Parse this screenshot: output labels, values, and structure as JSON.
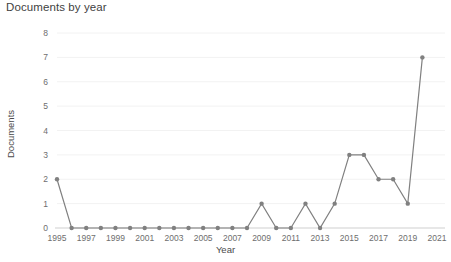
{
  "chart_data": {
    "type": "line",
    "title": "Documents by year",
    "xlabel": "Year",
    "ylabel": "Documents",
    "x": [
      1995,
      1996,
      1997,
      1998,
      1999,
      2000,
      2001,
      2002,
      2003,
      2004,
      2005,
      2006,
      2007,
      2008,
      2009,
      2010,
      2011,
      2012,
      2013,
      2014,
      2015,
      2016,
      2017,
      2018,
      2019,
      2020
    ],
    "values": [
      2,
      0,
      0,
      0,
      0,
      0,
      0,
      0,
      0,
      0,
      0,
      0,
      0,
      0,
      1,
      0,
      0,
      1,
      0,
      1,
      3,
      3,
      2,
      2,
      1,
      7
    ],
    "series": [
      {
        "name": "Documents",
        "values": [
          2,
          0,
          0,
          0,
          0,
          0,
          0,
          0,
          0,
          0,
          0,
          0,
          0,
          0,
          1,
          0,
          0,
          1,
          0,
          1,
          3,
          3,
          2,
          2,
          1,
          7
        ],
        "color": "#808080"
      }
    ],
    "xlim": [
      1995,
      2021
    ],
    "ylim": [
      0,
      8
    ],
    "xticks": [
      1995,
      1997,
      1999,
      2001,
      2003,
      2005,
      2007,
      2009,
      2011,
      2013,
      2015,
      2017,
      2019,
      2021
    ],
    "yticks": [
      0,
      1,
      2,
      3,
      4,
      5,
      6,
      7,
      8
    ],
    "xtick_labels": [
      "1995",
      "1997",
      "1999",
      "2001",
      "2003",
      "2005",
      "2007",
      "2009",
      "2011",
      "2013",
      "2015",
      "2017",
      "2019",
      "2021"
    ],
    "ytick_labels": [
      "0",
      "1",
      "2",
      "3",
      "4",
      "5",
      "6",
      "7",
      "8"
    ],
    "grid": true,
    "grid_color": "#f2f2f2",
    "legend": null,
    "legend_position": "none",
    "marker": "circle",
    "background_color": "#ffffff",
    "axis_color": "#cfcfcf",
    "text_color": "#4a4a4a"
  }
}
